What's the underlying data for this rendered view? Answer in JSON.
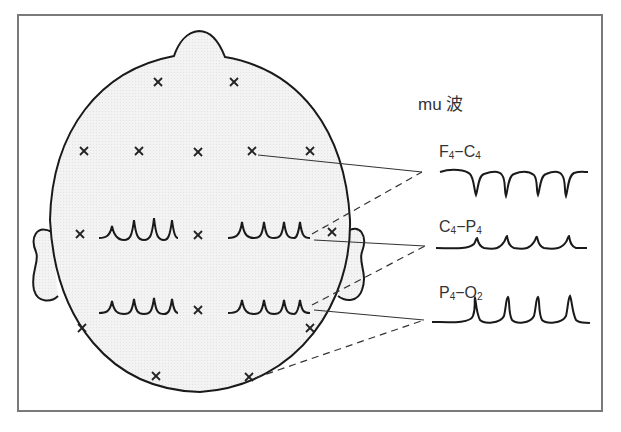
{
  "diagram": {
    "title": "mu 波",
    "frame_color": "#7a7a7a",
    "head_fill": "#f1f1f1",
    "stroke": "#1a1a1a",
    "channels": [
      {
        "label_main_1": "F",
        "sub_1": "4",
        "dash": "−",
        "label_main_2": "C",
        "sub_2": "4",
        "full": "F4−C4",
        "waveform": "negative sharp troughs (4)"
      },
      {
        "label_main_1": "C",
        "sub_1": "4",
        "dash": "−",
        "label_main_2": "P",
        "sub_2": "4",
        "full": "C4−P4",
        "waveform": "small positive peaks (4)"
      },
      {
        "label_main_1": "P",
        "sub_1": "4",
        "dash": "−",
        "label_main_2": "O",
        "sub_2": "2",
        "full": "P4−O2",
        "waveform": "tall positive peaks (4)"
      }
    ],
    "electrode_marker": "×",
    "electrodes_count": 16,
    "scalp_waveforms": [
      "left-central",
      "right-central",
      "left-parietal",
      "right-parietal"
    ]
  }
}
